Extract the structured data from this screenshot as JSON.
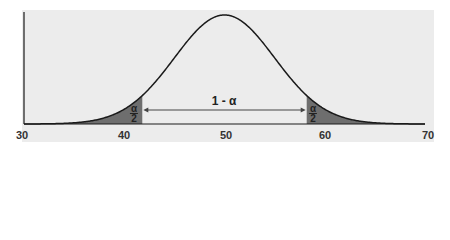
{
  "chart_data": {
    "type": "area",
    "title": "",
    "xlabel": "",
    "ylabel": "",
    "distribution": "normal",
    "mean": 50,
    "sd": 5,
    "xlim": [
      30,
      70
    ],
    "x_ticks": [
      "30",
      "40",
      "50",
      "60",
      "70"
    ],
    "shaded_tails": [
      {
        "from": 30,
        "to": 41.8,
        "label_num": "α",
        "label_den": "2"
      },
      {
        "from": 58.2,
        "to": 70,
        "label_num": "α",
        "label_den": "2"
      }
    ],
    "center_interval": {
      "from": 41.8,
      "to": 58.2,
      "label": "1 - α"
    },
    "grid": false,
    "legend": null
  },
  "colors": {
    "background": "#ececec",
    "curve": "#1a1a1a",
    "tail_fill": "#6e6e6e",
    "arrow": "#444444"
  }
}
